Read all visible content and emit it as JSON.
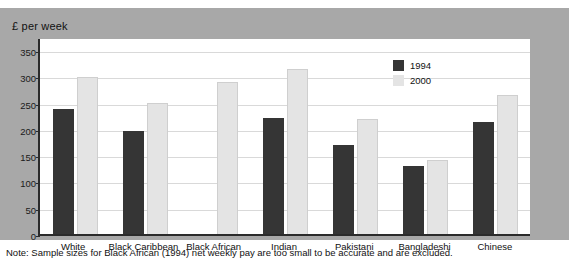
{
  "panel": {
    "title": "£ per week"
  },
  "note": {
    "text": "Note: Sample sizes for Black African (1994) net weekly pay are too small to be accurate and are excluded."
  },
  "colors": {
    "series_1994": "#353535",
    "series_2000": "#e4e4e4",
    "panel_background": "#a8a8a8",
    "plot_background": "#ffffff",
    "gridline": "#d9d9d9",
    "axis": "#2b2b2b"
  },
  "chart_data": {
    "type": "bar",
    "title": "£ per week",
    "xlabel": "",
    "ylabel": "£ per week",
    "ylim": [
      0,
      375
    ],
    "yticks": [
      0,
      50,
      100,
      150,
      200,
      250,
      300,
      350
    ],
    "ytick_labels": [
      "0",
      "50",
      "100",
      "150",
      "200",
      "250",
      "300",
      "350"
    ],
    "grid": true,
    "legend_position": "inside-top-right",
    "categories": [
      "White",
      "Black Caribbean",
      "Black African",
      "Indian",
      "Pakistani",
      "Bangladeshi",
      "Chinese"
    ],
    "series": [
      {
        "name": "1994",
        "color": "#353535",
        "values": [
          238,
          196,
          null,
          220,
          170,
          130,
          213
        ]
      },
      {
        "name": "2000",
        "color": "#e4e4e4",
        "values": [
          299,
          250,
          290,
          315,
          218,
          141,
          265
        ]
      }
    ],
    "annotations": [
      "Note: Sample sizes for Black African (1994) net weekly pay are too small to be accurate and are excluded."
    ]
  }
}
